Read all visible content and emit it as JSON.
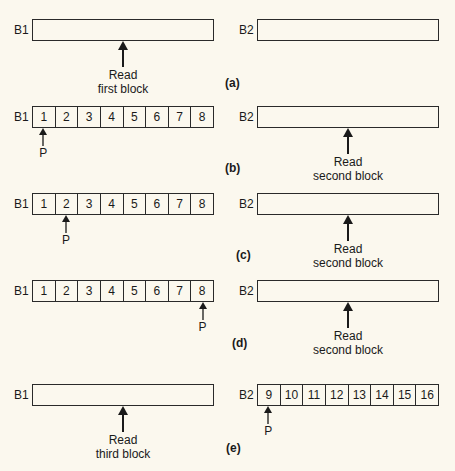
{
  "buffers": {
    "b1": "B1",
    "b2": "B2"
  },
  "pointer_label": "P",
  "captions": {
    "first": [
      "Read",
      "first block"
    ],
    "second": [
      "Read",
      "second block"
    ],
    "third": [
      "Read",
      "third block"
    ]
  },
  "rows": [
    {
      "part": "(a)",
      "b1_cells": [],
      "b2_cells": [],
      "pointer": null,
      "read": "first"
    },
    {
      "part": "(b)",
      "b1_cells": [
        "1",
        "2",
        "3",
        "4",
        "5",
        "6",
        "7",
        "8"
      ],
      "b2_cells": [],
      "pointer": {
        "buffer": "B1",
        "cell_index": 0
      },
      "read": "second"
    },
    {
      "part": "(c)",
      "b1_cells": [
        "1",
        "2",
        "3",
        "4",
        "5",
        "6",
        "7",
        "8"
      ],
      "b2_cells": [],
      "pointer": {
        "buffer": "B1",
        "cell_index": 1
      },
      "read": "second"
    },
    {
      "part": "(d)",
      "b1_cells": [
        "1",
        "2",
        "3",
        "4",
        "5",
        "6",
        "7",
        "8"
      ],
      "b2_cells": [],
      "pointer": {
        "buffer": "B1",
        "cell_index": 7
      },
      "read": "second"
    },
    {
      "part": "(e)",
      "b1_cells": [],
      "b2_cells": [
        "9",
        "10",
        "11",
        "12",
        "13",
        "14",
        "15",
        "16"
      ],
      "pointer": {
        "buffer": "B2",
        "cell_index": 0
      },
      "read": "third"
    }
  ]
}
